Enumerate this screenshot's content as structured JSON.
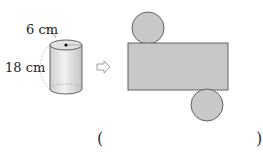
{
  "figure": {
    "labels": {
      "radius": "6 cm",
      "height": "18 cm"
    },
    "arrow_icon": "right-arrow-outline",
    "net": {
      "shapes": [
        "circle-top",
        "rectangle",
        "circle-bottom"
      ]
    },
    "answer_blank": {
      "open": "(",
      "close": ")"
    },
    "colors": {
      "fill": "#c8c8c8",
      "stroke": "#555555",
      "cylinder_fill": "#dcdcdc"
    }
  }
}
